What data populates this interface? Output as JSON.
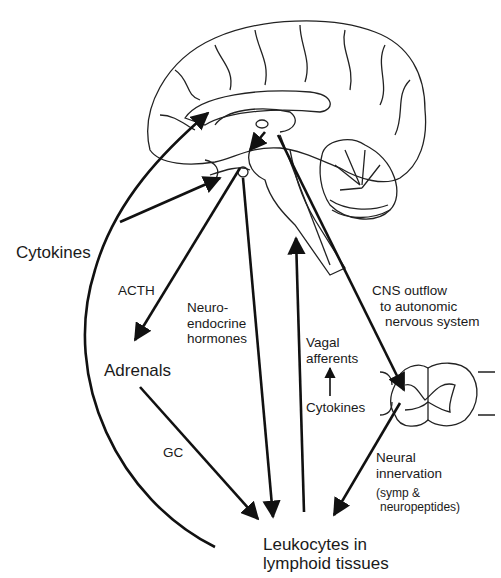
{
  "diagram": {
    "type": "neuroimmune-pathways",
    "labels": {
      "cytokines_left": "Cytokines",
      "acth": "ACTH",
      "neuroendocrine": [
        "Neuro-",
        "endocrine",
        "hormones"
      ],
      "vagal": [
        "Vagal",
        "afferents"
      ],
      "cytokines_center": "Cytokines",
      "cns_outflow": [
        "CNS outflow",
        "to autonomic",
        "nervous system"
      ],
      "adrenals": "Adrenals",
      "gc": "GC",
      "neural_innervation": [
        "Neural",
        "innervation"
      ],
      "neural_detail": [
        "(symp &",
        "neuropeptides)"
      ],
      "leukocytes": [
        "Leukocytes in",
        "lymphoid tissues"
      ]
    },
    "nodes": [
      "Brain (sagittal section)",
      "Spinal cord cross-section",
      "Adrenals",
      "Leukocytes in lymphoid tissues"
    ],
    "edges": [
      {
        "from": "Leukocytes in lymphoid tissues",
        "to": "Brain",
        "label": "Cytokines"
      },
      {
        "from": "Brain (pituitary)",
        "to": "Adrenals",
        "label": "ACTH"
      },
      {
        "from": "Adrenals",
        "to": "Leukocytes in lymphoid tissues",
        "label": "GC"
      },
      {
        "from": "Brain (pituitary)",
        "to": "Leukocytes in lymphoid tissues",
        "label": "Neuroendocrine hormones"
      },
      {
        "from": "Leukocytes in lymphoid tissues",
        "to": "Brainstem",
        "label": "Vagal afferents"
      },
      {
        "from": "Brain",
        "to": "Spinal cord",
        "label": "CNS outflow to autonomic nervous system"
      },
      {
        "from": "Spinal cord",
        "to": "Leukocytes in lymphoid tissues",
        "label": "Neural innervation (symp & neuropeptides)"
      }
    ],
    "colors": {
      "line": "#111111",
      "background": "#ffffff"
    }
  }
}
